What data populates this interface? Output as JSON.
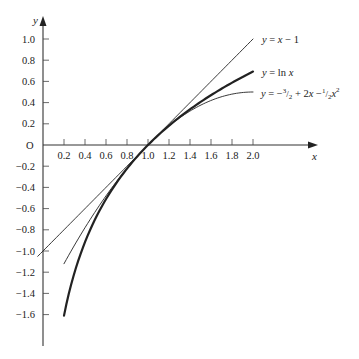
{
  "chart_data": {
    "type": "line",
    "title": "",
    "xlabel": "x",
    "ylabel": "y",
    "origin_label": "O",
    "xlim": [
      0,
      2.6
    ],
    "ylim": [
      -1.9,
      1.2
    ],
    "grid": false,
    "legend_position": "inline labels at right ends of curves",
    "x_ticks": [
      0.2,
      0.4,
      0.6,
      0.8,
      1.0,
      1.2,
      1.4,
      1.6,
      1.8,
      2.0
    ],
    "x_tick_labels": [
      "0.2",
      "0.4",
      "0.6",
      "0.8",
      "1.0",
      "1.2",
      "1.4",
      "1.6",
      "1.8",
      "2.0"
    ],
    "y_ticks": [
      1.0,
      0.8,
      0.6,
      0.4,
      0.2,
      -0.2,
      -0.4,
      -0.6,
      -0.8,
      -1.0,
      -1.2,
      -1.4,
      -1.6
    ],
    "y_tick_labels": [
      "1.0",
      "0.8",
      "0.6",
      "0.4",
      "0.2",
      "−0.2",
      "−0.4",
      "−0.6",
      "−0.8",
      "−1.0",
      "−1.2",
      "−1.4",
      "−1.6"
    ],
    "series": [
      {
        "name": "y = x − 1",
        "label": "y = x − 1",
        "style": "thin",
        "x": [
          -0.05,
          0.2,
          0.4,
          0.6,
          0.8,
          1.0,
          1.2,
          1.4,
          1.6,
          1.8,
          2.0
        ],
        "y": [
          -1.05,
          -0.8,
          -0.6,
          -0.4,
          -0.2,
          0.0,
          0.2,
          0.4,
          0.6,
          0.8,
          1.0
        ]
      },
      {
        "name": "y = ln x",
        "label": "y = ln x",
        "style": "thick",
        "x": [
          0.2,
          0.3,
          0.4,
          0.5,
          0.6,
          0.7,
          0.8,
          0.9,
          1.0,
          1.2,
          1.4,
          1.6,
          1.8,
          2.0
        ],
        "y": [
          -1.609,
          -1.204,
          -0.916,
          -0.693,
          -0.511,
          -0.357,
          -0.223,
          -0.105,
          0.0,
          0.182,
          0.336,
          0.47,
          0.588,
          0.693
        ]
      },
      {
        "name": "y = −3/2 + 2x − 1/2 x²",
        "label": "y = −³⁄₂ + 2x −¹⁄₂x²",
        "style": "thin",
        "x": [
          0.2,
          0.4,
          0.6,
          0.8,
          1.0,
          1.2,
          1.4,
          1.6,
          1.8,
          2.0
        ],
        "y": [
          -1.12,
          -0.78,
          -0.48,
          -0.22,
          0.0,
          0.18,
          0.32,
          0.42,
          0.48,
          0.5
        ]
      }
    ]
  }
}
